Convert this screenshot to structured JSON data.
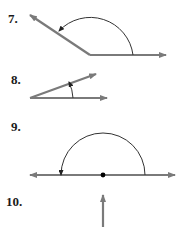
{
  "problems": [
    {
      "number": "7.",
      "description": "obtuse angle with counterclockwise arc from horizontal ray to upper-left ray"
    },
    {
      "number": "8.",
      "description": "acute angle with counterclockwise arc from horizontal ray to upper-right ray"
    },
    {
      "number": "9.",
      "description": "straight angle: line with vertex point and semicircular arc"
    },
    {
      "number": "10.",
      "description": "vertical ray pointing up"
    }
  ],
  "colors": {
    "ray": "#7a7a7a",
    "arc": "#333333",
    "label": "#1a1a1a",
    "point": "#000000"
  }
}
